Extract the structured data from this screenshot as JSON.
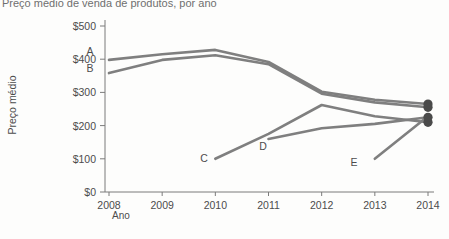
{
  "chart_data": {
    "type": "line",
    "title": "Preço médio de venda de produtos, por ano",
    "xlabel": "Ano",
    "ylabel": "Preço médio",
    "x": [
      2008,
      2009,
      2010,
      2011,
      2012,
      2013,
      2014
    ],
    "xtick_labels": [
      "2008",
      "2009",
      "2010",
      "2011",
      "2012",
      "2013",
      "2014"
    ],
    "ytick_labels": [
      "$0",
      "$100",
      "$200",
      "$300",
      "$400",
      "$500"
    ],
    "ytick_values": [
      0,
      100,
      200,
      300,
      400,
      500
    ],
    "ylim": [
      0,
      500
    ],
    "xlim": [
      2008,
      2014
    ],
    "grid": false,
    "legend": "inline-labels",
    "line_color": "#7f7f7f",
    "marker_color": "#4a4a4a",
    "series": [
      {
        "name": "A",
        "label": "A",
        "x": [
          2008,
          2009,
          2010,
          2011,
          2012,
          2013,
          2014
        ],
        "values": [
          398,
          415,
          428,
          392,
          302,
          278,
          265
        ],
        "endpoint_marker": true
      },
      {
        "name": "B",
        "label": "B",
        "x": [
          2008,
          2009,
          2010,
          2011,
          2012,
          2013,
          2014
        ],
        "values": [
          358,
          398,
          412,
          385,
          296,
          270,
          255
        ],
        "endpoint_marker": true
      },
      {
        "name": "C",
        "label": "C",
        "x": [
          2010,
          2011,
          2012,
          2013,
          2014
        ],
        "values": [
          100,
          175,
          262,
          228,
          210
        ],
        "endpoint_marker": true
      },
      {
        "name": "D",
        "label": "D",
        "x": [
          2011,
          2012,
          2013,
          2014
        ],
        "values": [
          160,
          192,
          205,
          225
        ],
        "endpoint_marker": true
      },
      {
        "name": "E",
        "label": "E",
        "x": [
          2013,
          2014
        ],
        "values": [
          100,
          228
        ],
        "endpoint_marker": false
      }
    ]
  }
}
